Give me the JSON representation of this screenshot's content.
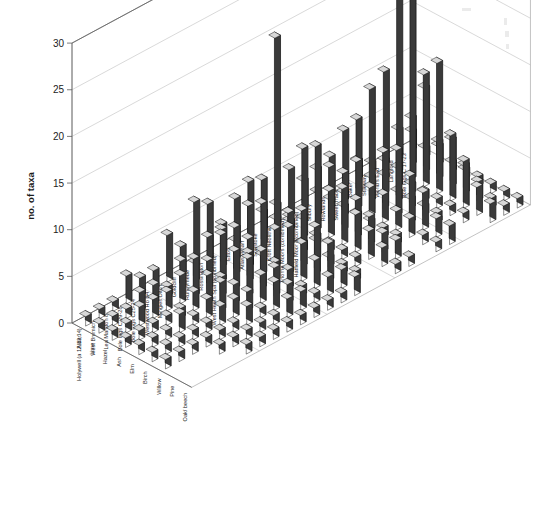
{
  "chart_data": {
    "type": "bar",
    "subtype": "3d-bar",
    "title": "",
    "xlabel": "",
    "ylabel": "no. of taxa",
    "zlabel": "",
    "ylim": [
      0,
      30
    ],
    "ytick_labels": [
      "0",
      "5",
      "10",
      "15",
      "20",
      "25",
      "30"
    ],
    "yticks": [
      0,
      5,
      10,
      15,
      20,
      25,
      30
    ],
    "grid": true,
    "legend": "none",
    "sites": [
      "Holywell (a 12,13,14)",
      "West Bromich",
      "Lea Marston 8",
      "Bole Ings C 29-28",
      "Bole Ings C25-24",
      "Westwood Ho B4",
      "Mingies Ditch",
      "Goldcliff",
      "Runnymede",
      "Rossington",
      "West Heath Spa (combined)",
      "Etton",
      "Atlas Wharf",
      "Shustoke",
      "Croft Neolithic",
      "Thorne Moors (combined)",
      "Hatfield Moor 8(combined)",
      "Silbury",
      "Rowlands",
      "Sweet Track",
      "Baker",
      "Stileway",
      "World's End",
      "Langford",
      "Bole Ings C 17-23"
    ],
    "species": [
      "Alder",
      "Lime",
      "Hazel",
      "Ash",
      "Elm",
      "Birch",
      "Willow",
      "Pine",
      "Oak/ beech"
    ],
    "series": [
      {
        "name": "Alder",
        "values": [
          1,
          1,
          1,
          3,
          2,
          2,
          5,
          3,
          7,
          6,
          3,
          5,
          6,
          2,
          2,
          5,
          3,
          1,
          4,
          6,
          2,
          1,
          10,
          3,
          2
        ]
      },
      {
        "name": "Lime",
        "values": [
          1,
          1,
          1,
          2,
          2,
          1,
          3,
          2,
          4,
          4,
          2,
          5,
          7,
          2,
          1,
          8,
          5,
          1,
          3,
          8,
          1,
          2,
          20,
          5,
          1
        ]
      },
      {
        "name": "Hazel",
        "values": [
          1,
          1,
          2,
          2,
          2,
          3,
          4,
          3,
          5,
          5,
          3,
          6,
          23,
          3,
          2,
          9,
          6,
          1,
          5,
          12,
          2,
          2,
          27,
          9,
          2
        ]
      },
      {
        "name": "Ash",
        "values": [
          1,
          1,
          1,
          1,
          1,
          2,
          3,
          2,
          4,
          3,
          2,
          4,
          5,
          1,
          1,
          5,
          4,
          1,
          3,
          6,
          1,
          1,
          12,
          4,
          1
        ]
      },
      {
        "name": "Elm",
        "values": [
          1,
          1,
          1,
          2,
          1,
          2,
          3,
          2,
          4,
          4,
          2,
          5,
          6,
          2,
          1,
          6,
          4,
          1,
          3,
          7,
          1,
          1,
          14,
          5,
          1
        ]
      },
      {
        "name": "Birch",
        "values": [
          1,
          1,
          1,
          1,
          1,
          2,
          2,
          2,
          3,
          3,
          2,
          4,
          5,
          1,
          1,
          4,
          3,
          1,
          2,
          5,
          1,
          1,
          7,
          3,
          1
        ]
      },
      {
        "name": "Willow",
        "values": [
          1,
          1,
          1,
          1,
          1,
          1,
          2,
          1,
          3,
          2,
          1,
          3,
          4,
          1,
          1,
          3,
          2,
          1,
          2,
          4,
          1,
          1,
          5,
          2,
          1
        ]
      },
      {
        "name": "Pine",
        "values": [
          0,
          0,
          0,
          1,
          1,
          1,
          1,
          1,
          2,
          2,
          1,
          2,
          2,
          1,
          0,
          2,
          2,
          0,
          1,
          2,
          0,
          1,
          3,
          1,
          1
        ]
      },
      {
        "name": "Oak/ beech",
        "values": [
          0,
          0,
          0,
          0,
          1,
          1,
          1,
          1,
          1,
          1,
          1,
          1,
          2,
          0,
          0,
          1,
          1,
          0,
          1,
          2,
          0,
          0,
          2,
          1,
          1
        ]
      }
    ]
  },
  "axes": {
    "y_axis_title": "no. of taxa"
  }
}
